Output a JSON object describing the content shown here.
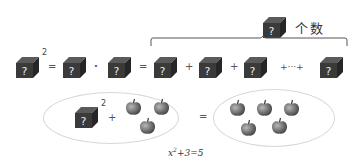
{
  "top_label": {
    "text": "个数"
  },
  "top_row": {
    "squared_exponent": "2",
    "equals_1": "=",
    "dot": "·",
    "equals_2": "=",
    "plus_1": "+",
    "plus_2": "+",
    "ellipsis": "+···+",
    "cube_glyph": "?"
  },
  "bottom": {
    "exponent": "2",
    "plus": "+",
    "equals": "=",
    "left_apples": 3,
    "right_apples": 5,
    "formula": {
      "var": "x",
      "exp": "2",
      "rest": "+3=5"
    }
  },
  "colors": {
    "cube_front": "#3a3a3a",
    "cube_top": "#5a5a5a",
    "cube_side": "#262626",
    "apple": "#7a7a7a",
    "ellipse_border": "#d8d8d8"
  },
  "icons": {
    "cube": "mystery-box-icon",
    "apple": "apple-icon"
  }
}
